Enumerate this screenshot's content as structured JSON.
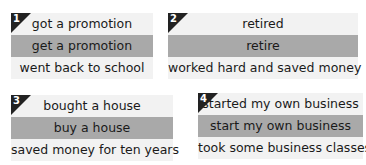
{
  "boxes": [
    {
      "number": "1",
      "rows": [
        "got a promotion",
        "get a promotion",
        "went back to school"
      ]
    },
    {
      "number": "2",
      "rows": [
        "retired",
        "retire",
        "worked hard and saved money"
      ]
    },
    {
      "number": "3",
      "rows": [
        "bought a house",
        "buy a house",
        "saved money for ten years"
      ]
    },
    {
      "number": "4",
      "rows": [
        "started my own business",
        "start my own business",
        "took some business classes"
      ]
    }
  ],
  "colors": {
    "light_row": "#f2f2f2",
    "dark_row": "#a9a9a9",
    "badge": "#222222"
  }
}
